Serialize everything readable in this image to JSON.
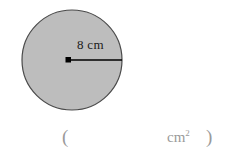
{
  "figure": {
    "shape": "circle",
    "fill_color": "#bdbdbd",
    "stroke_color": "#4a4a4a",
    "center_dot_color": "#000000",
    "radius_line_color": "#000000",
    "radius_label": "8 cm"
  },
  "answer": {
    "paren_open": "(",
    "blank": "",
    "unit": "cm",
    "unit_exponent": "2",
    "paren_close": ")",
    "text_color": "#9a9a9a"
  }
}
